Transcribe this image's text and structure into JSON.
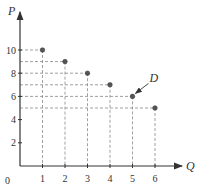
{
  "chart_data": {
    "type": "scatter",
    "title": "",
    "xlabel": "Q",
    "ylabel": "P",
    "origin_label": "0",
    "x_ticks": [
      1,
      2,
      3,
      4,
      5,
      6
    ],
    "y_ticks": [
      2,
      4,
      6,
      8,
      10
    ],
    "xlim": [
      0,
      7
    ],
    "ylim": [
      0,
      12
    ],
    "grid": false,
    "dashed_projections": true,
    "points": [
      {
        "x": 1,
        "y": 10
      },
      {
        "x": 2,
        "y": 9
      },
      {
        "x": 3,
        "y": 8
      },
      {
        "x": 4,
        "y": 7
      },
      {
        "x": 5,
        "y": 6,
        "label": "D"
      },
      {
        "x": 6,
        "y": 5
      }
    ],
    "annotations": [
      {
        "text": "D",
        "point": {
          "x": 5,
          "y": 6
        },
        "arrow": true
      }
    ],
    "colors": {
      "axis": "#333333",
      "point": "#555555",
      "dash": "#888888"
    }
  }
}
